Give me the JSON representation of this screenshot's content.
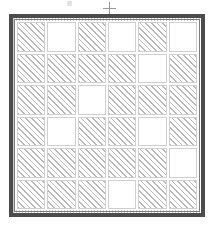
{
  "figure": {
    "grid": {
      "rows": 6,
      "columns": 6,
      "fill_legend": {
        "hatched": "diagonal-hatch-fill",
        "blank": "white-no-fill"
      },
      "cells": [
        [
          "hatched",
          "blank",
          "hatched",
          "blank",
          "hatched",
          "blank"
        ],
        [
          "hatched",
          "hatched",
          "hatched",
          "hatched",
          "blank",
          "hatched"
        ],
        [
          "hatched",
          "hatched",
          "blank",
          "hatched",
          "hatched",
          "hatched"
        ],
        [
          "hatched",
          "blank",
          "hatched",
          "hatched",
          "blank",
          "hatched"
        ],
        [
          "hatched",
          "hatched",
          "hatched",
          "hatched",
          "hatched",
          "blank"
        ],
        [
          "hatched",
          "hatched",
          "hatched",
          "blank",
          "hatched",
          "hatched"
        ]
      ],
      "counts": {
        "hatched": 28,
        "blank": 8,
        "total": 36
      }
    },
    "frame": {
      "style": "double-rule",
      "shape": "square"
    },
    "marks": [
      {
        "name": "registration-crosshair",
        "glyph": "+"
      },
      {
        "name": "ink-speck",
        "glyph": ""
      }
    ],
    "colors": {
      "background": "#ffffff",
      "frame": "#4c4c4c",
      "frame_inner_rule": "#7d7d7d",
      "hatch_line": "#b9b9b9",
      "cell_outline": "#cfcfcf",
      "mark": "#9a9a9a"
    }
  }
}
